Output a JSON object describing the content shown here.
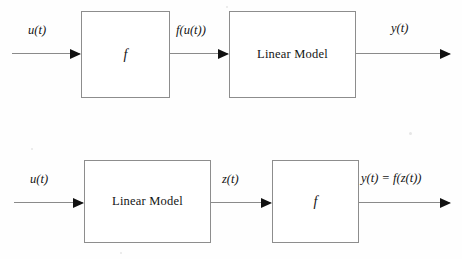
{
  "figure": {
    "type": "block-diagram",
    "background_color": "#fefefe",
    "line_color": "#8a8a8a",
    "text_color": "#141414",
    "width": 462,
    "height": 259
  },
  "diagrams": [
    {
      "id": "hammerstein",
      "row": 1,
      "blocks": [
        {
          "id": "nonlinearity",
          "label": "f",
          "style": "italic"
        },
        {
          "id": "linear-model",
          "label": "Linear Model",
          "style": "roman"
        }
      ],
      "signals": [
        {
          "id": "input",
          "label": "u(t)"
        },
        {
          "id": "intermediate",
          "label": "f(u(t))"
        },
        {
          "id": "output",
          "label": "y(t)"
        }
      ]
    },
    {
      "id": "wiener",
      "row": 2,
      "blocks": [
        {
          "id": "linear-model",
          "label": "Linear Model",
          "style": "roman"
        },
        {
          "id": "nonlinearity",
          "label": "f",
          "style": "italic"
        }
      ],
      "signals": [
        {
          "id": "input",
          "label": "u(t)"
        },
        {
          "id": "intermediate",
          "label": "z(t)"
        },
        {
          "id": "output",
          "label": "y(t) = f(z(t))"
        }
      ]
    }
  ]
}
